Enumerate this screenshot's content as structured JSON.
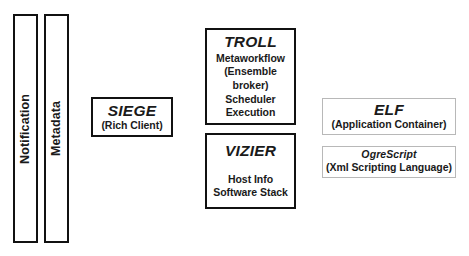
{
  "diagram": {
    "type": "architecture-block-diagram",
    "background_color": "#ffffff",
    "heavy_border_color": "#111111",
    "light_border_color": "#b8b8b8",
    "nodes": {
      "notification": {
        "label": "Notification",
        "orientation": "vertical",
        "border": "heavy"
      },
      "metadata": {
        "label": "Metadata",
        "orientation": "vertical",
        "border": "heavy"
      },
      "siege": {
        "title": "SIEGE",
        "subtitle": "(Rich Client)",
        "border": "heavy"
      },
      "troll": {
        "title": "TROLL",
        "lines": [
          "Metaworkflow",
          "(Ensemble",
          "broker)",
          "Scheduler",
          "Execution"
        ],
        "border": "heavy"
      },
      "vizier": {
        "title": "VIZIER",
        "lines": [
          "Host Info",
          "Software Stack"
        ],
        "border": "heavy"
      },
      "elf": {
        "title": "ELF",
        "subtitle": "(Application Container)",
        "border": "light"
      },
      "ogrescript": {
        "title": "OgreScript",
        "subtitle": "(Xml Scripting Language)",
        "border": "light"
      }
    }
  }
}
